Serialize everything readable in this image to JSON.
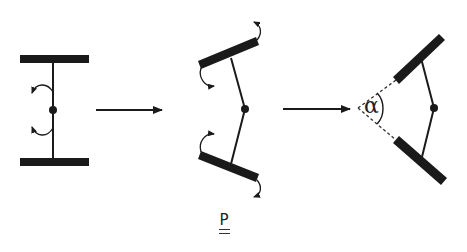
{
  "diagram": {
    "stages": [
      {
        "id": "stage-1",
        "name": "straight",
        "annotation": "two opposite rotation arrows at central hinge"
      },
      {
        "id": "stage-2",
        "name": "bending",
        "annotation": "rotation arrows at plate ends"
      },
      {
        "id": "stage-3",
        "name": "folded",
        "annotation": "angle between plates"
      }
    ],
    "angle_label": "α",
    "bottom_label": "P",
    "colors": {
      "stroke": "#1a1a1a",
      "dashed": "#333333",
      "background": "#ffffff"
    }
  }
}
